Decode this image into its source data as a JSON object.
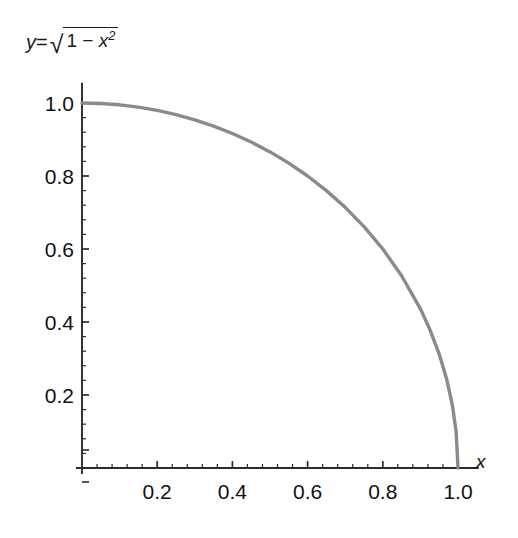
{
  "chart_data": {
    "type": "line",
    "title_parts": {
      "lhs_var": "y",
      "equals": "=",
      "radical_sign": "√",
      "radicand_first": "1",
      "minus": "−",
      "radicand_var": "x",
      "radicand_exp": "2"
    },
    "equation": "y = sqrt(1 - x^2)",
    "xlabel": "x",
    "ylabel": "",
    "xlim": [
      0,
      1.05
    ],
    "ylim": [
      0,
      1.05
    ],
    "grid": false,
    "legend": null,
    "xticks": [
      "0.2",
      "0.4",
      "0.6",
      "0.8",
      "1.0"
    ],
    "xtick_values": [
      0.2,
      0.4,
      0.6,
      0.8,
      1.0
    ],
    "yticks": [
      "0.2",
      "0.4",
      "0.6",
      "0.8",
      "1.0"
    ],
    "ytick_values": [
      0.2,
      0.4,
      0.6,
      0.8,
      1.0
    ],
    "minor_ticks_per_interval": 4,
    "x": [
      0,
      0.05,
      0.1,
      0.15,
      0.2,
      0.25,
      0.3,
      0.35,
      0.4,
      0.45,
      0.5,
      0.55,
      0.6,
      0.65,
      0.7,
      0.75,
      0.8,
      0.85,
      0.9,
      0.925,
      0.95,
      0.97,
      0.985,
      0.995,
      1.0
    ],
    "y": [
      1.0,
      0.9987,
      0.995,
      0.9887,
      0.9798,
      0.9682,
      0.9539,
      0.9367,
      0.9165,
      0.893,
      0.866,
      0.8352,
      0.8,
      0.7599,
      0.7141,
      0.6614,
      0.6,
      0.5268,
      0.4359,
      0.38,
      0.3122,
      0.2431,
      0.1723,
      0.0999,
      0.0
    ],
    "series_color": "#8a8a8a",
    "series_width_px": 3.4,
    "axis_color": "#2b2b2b",
    "text_color": "#111111",
    "background": "#ffffff"
  },
  "figure": {
    "name": "quarter-unit-circle-plot"
  }
}
